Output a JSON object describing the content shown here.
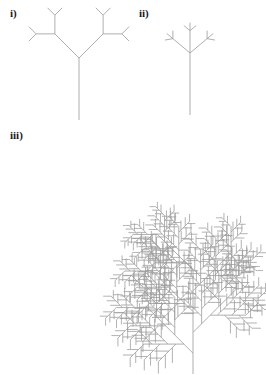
{
  "figure": {
    "background_color": "#ffffff",
    "stroke_color": "#9a9a9a",
    "stroke_width": 0.8,
    "width": 266,
    "height": 375,
    "caption_style": "bold roman numerals with closing parenthesis"
  },
  "labels": {
    "i": "i)",
    "ii": "ii)",
    "iii": "iii)"
  },
  "panels": [
    {
      "id": "panel-i",
      "label": "i)",
      "label_position": {
        "x": 10,
        "y": 8
      },
      "tree_name": "symmetric-binary-fractal-tree",
      "description": "Symmetric binary tree: trunk splits into two equal branches, each recursively splitting.",
      "root": {
        "x": 79,
        "y": 120
      },
      "initial_angle_deg": -90,
      "initial_length": 62,
      "branch_angle_deg": 45,
      "length_ratio": 0.55,
      "branches_per_node": 2,
      "depth": 4
    },
    {
      "id": "panel-ii",
      "label": "ii)",
      "label_position": {
        "x": 139,
        "y": 8
      },
      "tree_name": "ternary-trident-fractal-tree",
      "description": "Ternary trident tree: stem ends in three branches (left, centre, right), each recursively a trident.",
      "root": {
        "x": 190,
        "y": 115
      },
      "initial_angle_deg": -90,
      "initial_length": 62,
      "branch_angle_deg": 50,
      "length_ratio": 0.36,
      "branches_per_node": 3,
      "depth": 3
    },
    {
      "id": "panel-iii",
      "label": "iii)",
      "label_position": {
        "x": 10,
        "y": 130
      },
      "tree_name": "asymmetric-alternating-fractal-tree",
      "description": "Large asymmetric tree: a long axis bearing alternating side branches at 45 degrees, each side branch itself an identical smaller tree.",
      "root": {
        "x": 193,
        "y": 374
      },
      "initial_angle_deg": -90,
      "initial_length": 104,
      "branch_angle_deg": 45,
      "length_ratio": 0.62,
      "segments_per_axis": 5,
      "depth": 5
    }
  ],
  "chart_data": {
    "type": "diagram",
    "title": "",
    "subtitle": "",
    "items": [
      {
        "label": "i)",
        "kind": "binary fractal tree",
        "order": 1
      },
      {
        "label": "ii)",
        "kind": "ternary fractal tree",
        "order": 2
      },
      {
        "label": "iii)",
        "kind": "asymmetric fractal tree",
        "order": 3
      }
    ]
  }
}
